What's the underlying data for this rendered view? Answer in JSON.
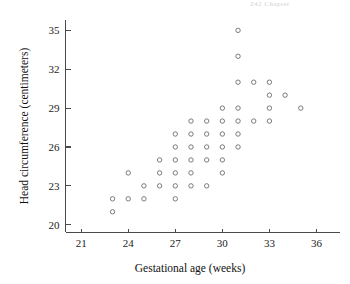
{
  "page_header": "242   Chapter",
  "chart_data": {
    "type": "scatter",
    "title": "",
    "xlabel": "Gestational age (weeks)",
    "ylabel": "Head circumference (centimeters)",
    "xlim": [
      20,
      37.5
    ],
    "ylim": [
      19.4,
      35.8
    ],
    "xticks": [
      21,
      24,
      27,
      30,
      33,
      36
    ],
    "yticks": [
      20,
      23,
      26,
      29,
      32,
      35
    ],
    "grid": false,
    "legend": null,
    "marker": "open-circle",
    "marker_color": "#6d6d6d",
    "points": [
      {
        "x": 23,
        "y": 22
      },
      {
        "x": 23,
        "y": 21
      },
      {
        "x": 24,
        "y": 22
      },
      {
        "x": 24,
        "y": 24
      },
      {
        "x": 25,
        "y": 22
      },
      {
        "x": 25,
        "y": 23
      },
      {
        "x": 26,
        "y": 23
      },
      {
        "x": 26,
        "y": 24
      },
      {
        "x": 26,
        "y": 25
      },
      {
        "x": 27,
        "y": 22
      },
      {
        "x": 27,
        "y": 23
      },
      {
        "x": 27,
        "y": 24
      },
      {
        "x": 27,
        "y": 25
      },
      {
        "x": 27,
        "y": 26
      },
      {
        "x": 27,
        "y": 27
      },
      {
        "x": 28,
        "y": 23
      },
      {
        "x": 28,
        "y": 24
      },
      {
        "x": 28,
        "y": 25
      },
      {
        "x": 28,
        "y": 26
      },
      {
        "x": 28,
        "y": 27
      },
      {
        "x": 28,
        "y": 28
      },
      {
        "x": 29,
        "y": 23
      },
      {
        "x": 29,
        "y": 25
      },
      {
        "x": 29,
        "y": 26
      },
      {
        "x": 29,
        "y": 27
      },
      {
        "x": 29,
        "y": 28
      },
      {
        "x": 30,
        "y": 24
      },
      {
        "x": 30,
        "y": 25
      },
      {
        "x": 30,
        "y": 26
      },
      {
        "x": 30,
        "y": 27
      },
      {
        "x": 30,
        "y": 28
      },
      {
        "x": 30,
        "y": 29
      },
      {
        "x": 31,
        "y": 26
      },
      {
        "x": 31,
        "y": 27
      },
      {
        "x": 31,
        "y": 28
      },
      {
        "x": 31,
        "y": 29
      },
      {
        "x": 31,
        "y": 31
      },
      {
        "x": 31,
        "y": 33
      },
      {
        "x": 31,
        "y": 35
      },
      {
        "x": 32,
        "y": 28
      },
      {
        "x": 32,
        "y": 31
      },
      {
        "x": 33,
        "y": 28
      },
      {
        "x": 33,
        "y": 29
      },
      {
        "x": 33,
        "y": 30
      },
      {
        "x": 33,
        "y": 31
      },
      {
        "x": 34,
        "y": 30
      },
      {
        "x": 35,
        "y": 29
      }
    ]
  }
}
